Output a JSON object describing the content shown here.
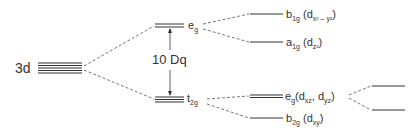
{
  "diagram": {
    "type": "crystal-field-splitting",
    "levels": {
      "free_ion": {
        "label": "3d"
      },
      "oh_upper": {
        "label": "e",
        "sub": "g"
      },
      "oh_lower": {
        "label": "t",
        "sub": "2g"
      },
      "gap": {
        "label": "10 Dq"
      },
      "b1g": {
        "label": "b",
        "sub": "1g",
        "orbital_pre": " (d",
        "orbital_sub": "x² – y²",
        "orbital_post": ")"
      },
      "a1g": {
        "label": "a",
        "sub": "1g",
        "orbital_pre": " (d",
        "orbital_sub": "z²",
        "orbital_post": ")"
      },
      "eg2": {
        "label": "e",
        "sub": "g",
        "orbital_pre": "(d",
        "orbital_sub": "xz",
        "orbital_mid": ", d",
        "orbital_sub2": "yz",
        "orbital_post": ")"
      },
      "b2g": {
        "label": "b",
        "sub": "2g",
        "orbital_pre": " (d",
        "orbital_sub": "xy",
        "orbital_post": ")"
      }
    },
    "colors": {
      "line": "#333333",
      "dashed": "#555555"
    }
  }
}
